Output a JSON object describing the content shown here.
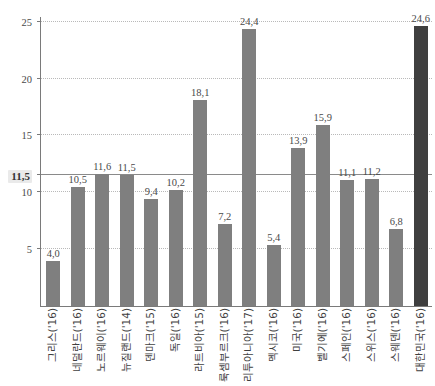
{
  "chart_data": {
    "type": "bar",
    "title": "",
    "subtitle": "",
    "xlabel": "",
    "ylabel": "",
    "ylim": [
      0,
      25.5
    ],
    "grid": true,
    "legend": "none",
    "decimal_separator": ",",
    "ytick_labels": [
      "5",
      "10",
      "15",
      "20",
      "25"
    ],
    "ytick_values": [
      5,
      10,
      15,
      20,
      25
    ],
    "reference_line": {
      "value": 11.5,
      "label": "11,5",
      "style": "solid",
      "label_highlight": "#eaeaea"
    },
    "colors": {
      "bar": "#7f7f7f",
      "bar_highlight": "#3f3f3f",
      "axis": "#7a7a7a",
      "gridline": "#b9b9b9",
      "text": "#3f3f3f"
    },
    "categories": [
      "그리스('16)",
      "네덜란드('16)",
      "노르웨이('16)",
      "뉴질랜드('14)",
      "덴마크('15)",
      "독일('16)",
      "라트비아('15)",
      "룩셈부르크('16)",
      "리투아니아('17)",
      "멕시코('16)",
      "미국('16)",
      "벨기에('16)",
      "스페인('16)",
      "스위스('16)",
      "스웨덴('16)",
      "대한민국('16)"
    ],
    "values": [
      4.0,
      10.5,
      11.6,
      11.5,
      9.4,
      10.2,
      18.1,
      7.2,
      24.4,
      5.4,
      13.9,
      15.9,
      11.1,
      11.2,
      6.8,
      24.6
    ],
    "value_labels": [
      "4,0",
      "10,5",
      "11,6",
      "11,5",
      "9,4",
      "10,2",
      "18,1",
      "7,2",
      "24,4",
      "5,4",
      "13,9",
      "15,9",
      "11,1",
      "11,2",
      "6,8",
      "24,6"
    ],
    "highlighted_index": 15
  }
}
